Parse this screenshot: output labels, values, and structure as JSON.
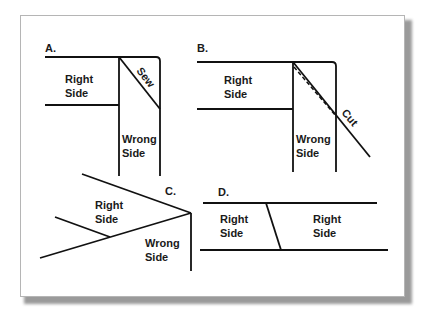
{
  "figure": {
    "panels": [
      {
        "id": "A",
        "label": "A.",
        "texts": {
          "right_side_1": "Right",
          "right_side_2": "Side",
          "wrong_side_1": "Wrong",
          "wrong_side_2": "Side",
          "action": "Sew"
        }
      },
      {
        "id": "B",
        "label": "B.",
        "texts": {
          "right_side_1": "Right",
          "right_side_2": "Side",
          "wrong_side_1": "Wrong",
          "wrong_side_2": "Side",
          "action": "Cut"
        }
      },
      {
        "id": "C",
        "label": "C.",
        "texts": {
          "right_side_1": "Right",
          "right_side_2": "Side",
          "wrong_side_1": "Wrong",
          "wrong_side_2": "Side"
        }
      },
      {
        "id": "D",
        "label": "D.",
        "texts": {
          "left_right_side_1": "Right",
          "left_right_side_2": "Side",
          "right_right_side_1": "Right",
          "right_right_side_2": "Side"
        }
      }
    ],
    "colors": {
      "line": "#111111",
      "frame_border": "#b5b5b5",
      "shadow": "#9a9a9a",
      "background": "#ffffff"
    }
  }
}
